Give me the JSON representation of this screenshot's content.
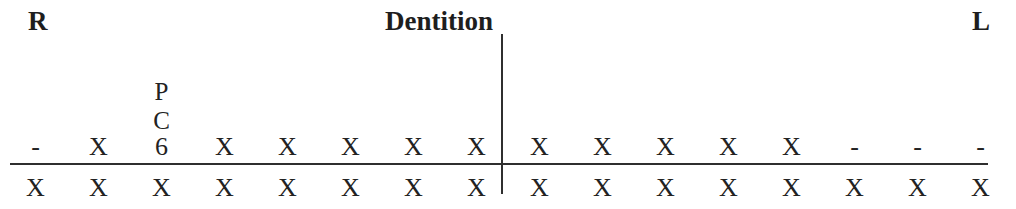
{
  "page": {
    "background": "#ffffff",
    "text_color": "#1e1e1e",
    "line_color": "#2f2f2f"
  },
  "header": {
    "right_marker": "R",
    "title": "Dentition",
    "left_marker": "L"
  },
  "dentition": {
    "upper_annotation": [
      "P",
      "C"
    ],
    "upper_row": [
      "-",
      "X",
      "6",
      "X",
      "X",
      "X",
      "X",
      "X",
      "X",
      "X",
      "X",
      "X",
      "X",
      "-",
      "-",
      "-"
    ],
    "lower_row": [
      "X",
      "X",
      "X",
      "X",
      "X",
      "X",
      "X",
      "X",
      "X",
      "X",
      "X",
      "X",
      "X",
      "X",
      "X",
      "X"
    ]
  }
}
